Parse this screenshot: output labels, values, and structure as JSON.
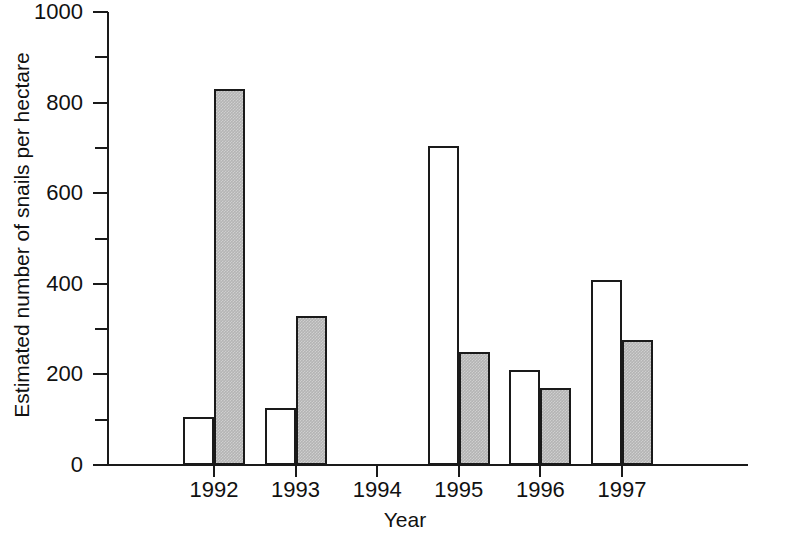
{
  "chart_data": {
    "type": "bar",
    "title": "",
    "xlabel": "Year",
    "ylabel": "Estimated number of snails per hectare",
    "categories": [
      "1992",
      "1993",
      "1994",
      "1995",
      "1996",
      "1997"
    ],
    "series": [
      {
        "name": "white-bars",
        "fill": "white",
        "values": [
          105,
          125,
          0,
          705,
          210,
          408
        ]
      },
      {
        "name": "gray-bars",
        "fill": "gray",
        "values": [
          830,
          328,
          0,
          250,
          170,
          275
        ]
      }
    ],
    "ylim": [
      0,
      1000
    ],
    "y_major_ticks": [
      0,
      200,
      400,
      600,
      800,
      1000
    ],
    "y_minor_ticks": [
      100,
      300,
      500,
      700,
      900
    ],
    "y_tick_labels": [
      "0",
      "200",
      "400",
      "600",
      "800",
      "1000"
    ],
    "grid": false,
    "legend": "none",
    "colors": {
      "axis": "#1a1a1a",
      "bar_outline": "#1a1a1a",
      "bar_white_fill": "#ffffff",
      "bar_gray_fill": "#b4b4b4",
      "background": "#ffffff",
      "text": "#111111"
    }
  }
}
